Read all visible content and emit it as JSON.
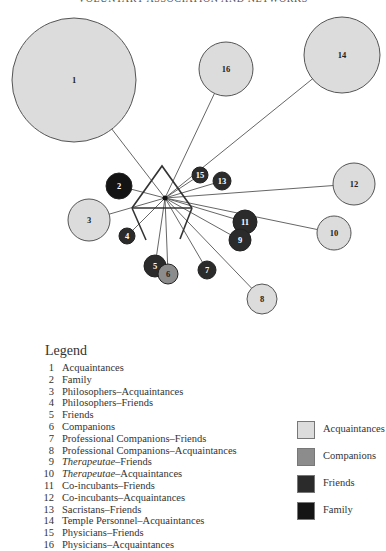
{
  "header": {
    "running_head": "VOLUNTARY ASSOCIATION AND NETWORKS"
  },
  "colors": {
    "acquaintances": "#dcdcdc",
    "companions": "#8c8c8c",
    "friends": "#2b2b2b",
    "family": "#141414",
    "line": "#555555",
    "hub": "#333333"
  },
  "network": {
    "hub": "temple-icon",
    "nodes": [
      {
        "id": "1",
        "category": "acquaintances"
      },
      {
        "id": "2",
        "category": "family"
      },
      {
        "id": "3",
        "category": "acquaintances"
      },
      {
        "id": "4",
        "category": "friends"
      },
      {
        "id": "5",
        "category": "friends"
      },
      {
        "id": "6",
        "category": "companions"
      },
      {
        "id": "7",
        "category": "friends"
      },
      {
        "id": "8",
        "category": "acquaintances"
      },
      {
        "id": "9",
        "category": "friends"
      },
      {
        "id": "10",
        "category": "acquaintances"
      },
      {
        "id": "11",
        "category": "friends"
      },
      {
        "id": "12",
        "category": "acquaintances"
      },
      {
        "id": "13",
        "category": "friends"
      },
      {
        "id": "14",
        "category": "acquaintances"
      },
      {
        "id": "15",
        "category": "friends"
      },
      {
        "id": "16",
        "category": "acquaintances"
      }
    ]
  },
  "legend": {
    "title": "Legend",
    "items": [
      {
        "num": "1",
        "italic": "",
        "label": "Acquaintances"
      },
      {
        "num": "2",
        "italic": "",
        "label": "Family"
      },
      {
        "num": "3",
        "italic": "",
        "label": "Philosophers–Acquaintances"
      },
      {
        "num": "4",
        "italic": "",
        "label": "Philosophers–Friends"
      },
      {
        "num": "5",
        "italic": "",
        "label": "Friends"
      },
      {
        "num": "6",
        "italic": "",
        "label": "Companions"
      },
      {
        "num": "7",
        "italic": "",
        "label": "Professional Companions–Friends"
      },
      {
        "num": "8",
        "italic": "",
        "label": "Professional Companions–Acquaintances"
      },
      {
        "num": "9",
        "italic": "Therapeutae",
        "label": "–Friends"
      },
      {
        "num": "10",
        "italic": "Therapeutae",
        "label": "–Acquaintances"
      },
      {
        "num": "11",
        "italic": "",
        "label": "Co-incubants–Friends"
      },
      {
        "num": "12",
        "italic": "",
        "label": "Co-incubants–Acquaintances"
      },
      {
        "num": "13",
        "italic": "",
        "label": "Sacristans–Friends"
      },
      {
        "num": "14",
        "italic": "",
        "label": "Temple Personnel–Acquaintances"
      },
      {
        "num": "15",
        "italic": "",
        "label": "Physicians–Friends"
      },
      {
        "num": "16",
        "italic": "",
        "label": "Physicians–Acquaintances"
      }
    ]
  },
  "key": [
    {
      "category": "acquaintances",
      "label": "Acquaintances"
    },
    {
      "category": "companions",
      "label": "Companions"
    },
    {
      "category": "friends",
      "label": "Friends"
    },
    {
      "category": "family",
      "label": "Family"
    }
  ]
}
